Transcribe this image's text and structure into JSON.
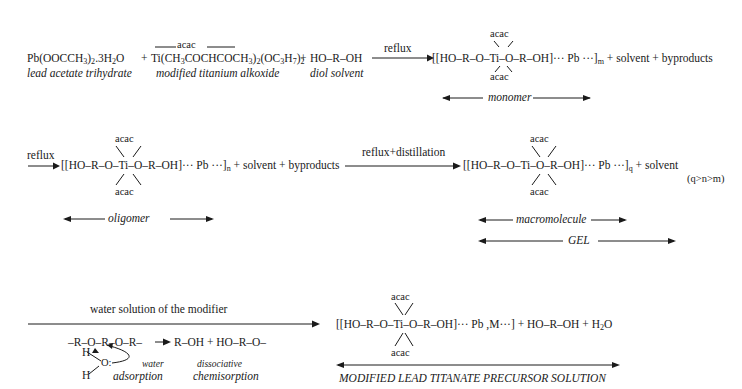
{
  "step1": {
    "reactant1": {
      "formula_parts": [
        "Pb(OOCCH",
        "3",
        ")",
        "2",
        ".3H",
        "2",
        "O"
      ],
      "label": "lead acetate trihydrate"
    },
    "plus1": "+",
    "reactant2": {
      "acac_label": "acac",
      "formula_parts": [
        "Ti(CH",
        "3",
        "COCHCOCH",
        "3",
        ")",
        "2",
        "(OC",
        "3",
        "H",
        "7",
        ")",
        "2"
      ],
      "label": "modified titanium alkoxide"
    },
    "plus2": "+",
    "reactant3": {
      "formula": "HO–R–OH",
      "label": "diol solvent"
    },
    "arrow_label": "reflux",
    "product": {
      "acac_top": "acac",
      "acac_bottom": "acac",
      "core": "[[HO–R–O–Ti–O–R–OH]··· Pb ···]",
      "subscript": "m",
      "tail": " + solvent + byproducts"
    },
    "bracket_label": "monomer"
  },
  "step2": {
    "arrow_label": "reflux",
    "product": {
      "acac_top": "acac",
      "acac_bottom": "acac",
      "core": "[[HO–R–O–Ti–O–R–OH]··· Pb ···]",
      "subscript": "n",
      "tail": " + solvent + byproducts"
    },
    "bracket_label": "oligomer"
  },
  "step3": {
    "arrow_label": "reflux+distillation",
    "product": {
      "acac_top": "acac",
      "acac_bottom": "acac",
      "core": "[[HO–R–O–Ti–O–R–OH]··· Pb ···]",
      "subscript": "q",
      "tail": " + solvent"
    },
    "condition": "(q>n>m)",
    "bracket_label_1": "macromolecule",
    "bracket_label_2": "GEL"
  },
  "step4": {
    "arrow_label": "water solution of the modifier",
    "mechanism": {
      "chain": "–R–O–R–O–R–",
      "products": "R–OH + HO–R–O–",
      "h_top": "H",
      "o_atom": "O:",
      "h_bottom": "H",
      "label_water": "water",
      "label_adsorption": "adsorption",
      "label_dissociative": "dissociative",
      "label_chemisorption": "chemisorption"
    },
    "product": {
      "acac_top": "acac",
      "acac_bottom": "acac",
      "core": "[[HO–R–O–Ti–O–R–OH]··· Pb ,M···]",
      "tail_parts": [
        " + HO–R–OH + H",
        "2",
        "O"
      ]
    },
    "bracket_label": "MODIFIED LEAD TITANATE PRECURSOR SOLUTION"
  }
}
